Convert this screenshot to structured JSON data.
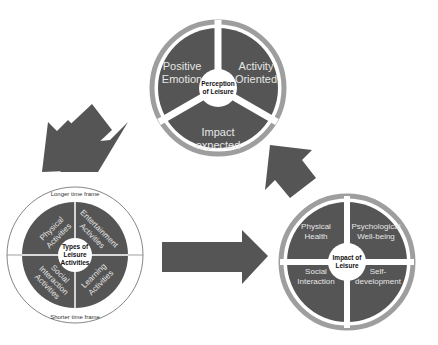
{
  "perception": {
    "center": [
      "Perception",
      "of Leisure"
    ],
    "segments": [
      {
        "lines": [
          "Positive",
          "Emotion"
        ]
      },
      {
        "lines": [
          "Activity",
          "Oriented"
        ]
      },
      {
        "lines": [
          "Impact",
          "expected"
        ]
      }
    ]
  },
  "types": {
    "center": [
      "Types of",
      "Leisure",
      "Activities"
    ],
    "top_label": "Longer time frame",
    "bottom_label": "Shorter time frame",
    "segments": [
      {
        "lines": [
          "Physical",
          "Activities"
        ]
      },
      {
        "lines": [
          "Entertainment",
          "Activities"
        ]
      },
      {
        "lines": [
          "Social",
          "Interaction",
          "Activities"
        ]
      },
      {
        "lines": [
          "Learning",
          "Activities"
        ]
      }
    ]
  },
  "impact": {
    "center": [
      "Impact of",
      "Leisure"
    ],
    "segments": [
      {
        "lines": [
          "Physical",
          "Health"
        ]
      },
      {
        "lines": [
          "Psychological",
          "Well-being"
        ]
      },
      {
        "lines": [
          "Social",
          "Interaction"
        ]
      },
      {
        "lines": [
          "Self-",
          "development"
        ]
      }
    ]
  },
  "colors": {
    "segment": "#555555",
    "ring": "#9e9e9e",
    "text": "#e6e6e6"
  }
}
